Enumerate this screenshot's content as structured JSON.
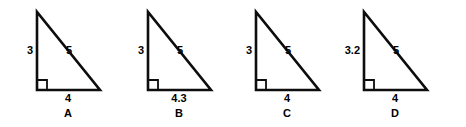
{
  "figure": {
    "type": "multiple-choice-geometry-figure",
    "background_color": "#ffffff",
    "line_color": "#0d0d0d",
    "text_color": "#000000",
    "shape": "right-triangle",
    "right_angle_position": "bottom-left",
    "choices": [
      {
        "letter": "A",
        "vertical_leg": "3",
        "hypotenuse": "5",
        "base": "4"
      },
      {
        "letter": "B",
        "vertical_leg": "3",
        "hypotenuse": "5",
        "base": "4.3"
      },
      {
        "letter": "C",
        "vertical_leg": "3",
        "hypotenuse": "5",
        "base": "4"
      },
      {
        "letter": "D",
        "vertical_leg": "3.2",
        "hypotenuse": "5",
        "base": "4"
      }
    ]
  }
}
